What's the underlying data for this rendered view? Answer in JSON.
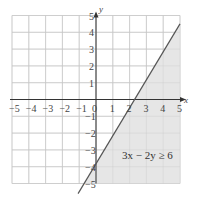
{
  "chart_data": {
    "type": "line",
    "title": "",
    "xlabel": "x",
    "ylabel": "y",
    "xlim": [
      -5,
      5
    ],
    "ylim": [
      -5,
      5
    ],
    "grid": true,
    "x_ticks": [
      "-5",
      "-4",
      "-3",
      "-2",
      "-1",
      "0",
      "1",
      "2",
      "3",
      "4",
      "5"
    ],
    "y_ticks": [
      "5",
      "4",
      "3",
      "2",
      "1",
      "-1",
      "-2",
      "-3",
      "-4",
      "-5"
    ],
    "series": [
      {
        "name": "3x - 2y = 6",
        "style": "solid boundary line",
        "points": [
          [
            -0.667,
            -5
          ],
          [
            0,
            -3
          ],
          [
            2,
            0
          ],
          [
            5,
            4.5
          ]
        ]
      }
    ],
    "shaded_region": {
      "inequality": "3x − 2y ≥ 6",
      "description": "region below/right of boundary line",
      "color": "#e6e6e6"
    },
    "annotations": [
      {
        "text": "3x − 2y ≥ 6",
        "x": 3.3,
        "y": -3.3
      }
    ]
  },
  "labels": {
    "x_axis": "x",
    "y_axis": "y",
    "inequality": "3x − 2y ≥ 6"
  }
}
